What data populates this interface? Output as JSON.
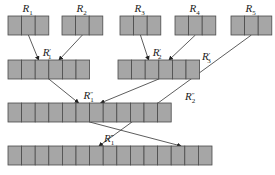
{
  "diagram": {
    "runs": [
      {
        "id": "R1",
        "label": "R",
        "sub": "1",
        "prime": "",
        "cells": 3,
        "x": 8,
        "y": 16
      },
      {
        "id": "R2",
        "label": "R",
        "sub": "2",
        "prime": "",
        "cells": 3,
        "x": 62,
        "y": 16
      },
      {
        "id": "R3",
        "label": "R",
        "sub": "3",
        "prime": "",
        "cells": 3,
        "x": 120,
        "y": 16
      },
      {
        "id": "R4",
        "label": "R",
        "sub": "4",
        "prime": "",
        "cells": 3,
        "x": 175,
        "y": 16
      },
      {
        "id": "R5",
        "label": "R",
        "sub": "5",
        "prime": "",
        "cells": 3,
        "x": 231,
        "y": 16
      },
      {
        "id": "R1p",
        "label": "R",
        "sub": "1",
        "prime": "′",
        "cells": 6,
        "x": 8,
        "y": 60
      },
      {
        "id": "R2p",
        "label": "R",
        "sub": "2",
        "prime": "′",
        "cells": 6,
        "x": 118,
        "y": 60
      },
      {
        "id": "R1pp",
        "label": "R",
        "sub": "1",
        "prime": "″",
        "cells": 12,
        "x": 8,
        "y": 103
      },
      {
        "id": "R1ppp",
        "label": "R",
        "sub": "1",
        "prime": "‴",
        "cells": 15,
        "x": 8,
        "y": 146
      }
    ],
    "edge_labels": [
      {
        "id": "R3p",
        "label": "R",
        "sub": "3",
        "prime": "′",
        "x": 202,
        "y": 60
      },
      {
        "id": "R2pp",
        "label": "R",
        "sub": "2",
        "prime": "″",
        "x": 185,
        "y": 100
      }
    ],
    "edges": [
      {
        "from": "R1",
        "to": "R1p"
      },
      {
        "from": "R2",
        "to": "R1p"
      },
      {
        "from": "R3",
        "to": "R2p"
      },
      {
        "from": "R4",
        "to": "R2p"
      },
      {
        "from": "R1p",
        "to": "R1pp"
      },
      {
        "from": "R2p",
        "to": "R1pp"
      },
      {
        "from": "R5",
        "to": "R1ppp"
      },
      {
        "from": "R1pp",
        "to": "R1ppp"
      }
    ],
    "colors": {
      "cell_fill": "#a6a6a6",
      "cell_stroke": "#4a4a4a",
      "arrow": "#333333"
    }
  }
}
